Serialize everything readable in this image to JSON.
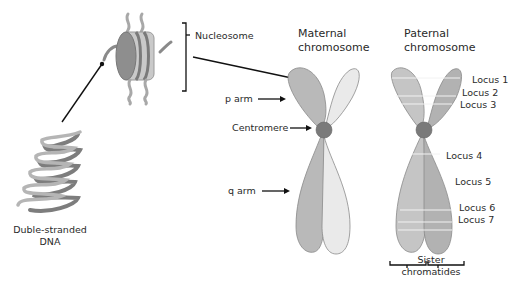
{
  "dna": {
    "label_line1": "Duble-stranded",
    "label_line2": "DNA"
  },
  "nucleosome": {
    "label": "Nucleosome"
  },
  "maternal": {
    "title_line1": "Maternal",
    "title_line2": "chromosome",
    "p_arm": "p arm",
    "centromere": "Centromere",
    "q_arm": "q arm"
  },
  "paternal": {
    "title_line1": "Paternal",
    "title_line2": "chromosome",
    "loci": [
      "Locus 1",
      "Locus 2",
      "Locus 3",
      "Locus 4",
      "Locus 5",
      "Locus 6",
      "Locus 7"
    ],
    "sister_line1": "Sister",
    "sister_line2": "chromatides"
  },
  "colors": {
    "dark_chromatid": "#b9b9b9",
    "light_chromatid": "#eaeaea",
    "centromere": "#7a7a7a",
    "outline": "#8a8a8a",
    "dna_dark": "#7d7d7d",
    "dna_light": "#b5b5b5"
  }
}
